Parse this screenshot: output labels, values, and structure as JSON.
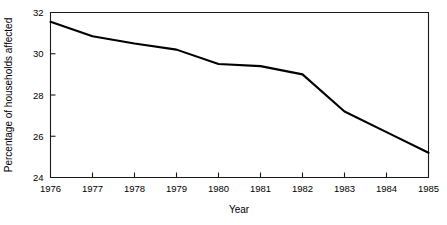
{
  "chart_data": {
    "type": "line",
    "title": "",
    "xlabel": "Year",
    "ylabel": "Percentage of households affected",
    "x": [
      1976,
      1977,
      1978,
      1979,
      1980,
      1981,
      1982,
      1983,
      1984,
      1985
    ],
    "values": [
      31.55,
      30.85,
      30.5,
      30.2,
      29.5,
      29.4,
      29.0,
      27.2,
      26.2,
      25.2
    ],
    "series": [
      {
        "name": "Percentage of households affected",
        "values": [
          31.55,
          30.85,
          30.5,
          30.2,
          29.5,
          29.4,
          29.0,
          27.2,
          26.2,
          25.2
        ]
      }
    ],
    "xlim": [
      1976,
      1985
    ],
    "ylim": [
      24,
      32
    ],
    "xticks": [
      1976,
      1977,
      1978,
      1979,
      1980,
      1981,
      1982,
      1983,
      1984,
      1985
    ],
    "xtick_labels": [
      "1976",
      "1977",
      "1978",
      "1979",
      "1980",
      "1981",
      "1982",
      "1983",
      "1984",
      "1985"
    ],
    "yticks": [
      24,
      26,
      28,
      30,
      32
    ],
    "ytick_labels": [
      "24",
      "26",
      "28",
      "30",
      "32"
    ],
    "grid": false,
    "legend": false,
    "legend_position": "none",
    "line_color": "#000000",
    "frame_color": "#1a1a1a",
    "background_color": "#ffffff"
  }
}
